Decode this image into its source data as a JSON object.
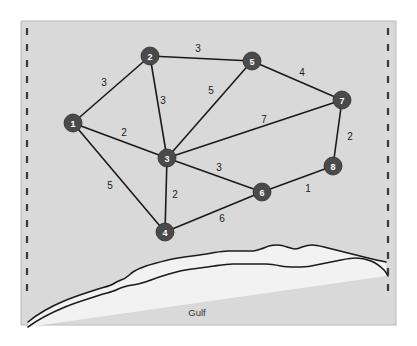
{
  "figure": {
    "caption": "Gulf",
    "background_color": "#d9d9d9",
    "frame_color": "#b9b9b9",
    "node_color": "#4a4a4a",
    "edge_color": "#1b1b1b",
    "dashed_border_color": "#3a3a3a",
    "coastline_color": "#1b1b1b",
    "water_color": "#f2f2f2"
  },
  "graph": {
    "type": "weighted-undirected-graph",
    "nodes": [
      {
        "id": "1",
        "label": "1",
        "x": 73,
        "y": 123
      },
      {
        "id": "2",
        "label": "2",
        "x": 150,
        "y": 56
      },
      {
        "id": "3",
        "label": "3",
        "x": 167,
        "y": 158
      },
      {
        "id": "4",
        "label": "4",
        "x": 165,
        "y": 232
      },
      {
        "id": "5",
        "label": "5",
        "x": 252,
        "y": 61
      },
      {
        "id": "6",
        "label": "6",
        "x": 262,
        "y": 192
      },
      {
        "id": "7",
        "label": "7",
        "x": 342,
        "y": 100
      },
      {
        "id": "8",
        "label": "8",
        "x": 333,
        "y": 166
      }
    ],
    "node_radius": 9,
    "edges": [
      {
        "from": "1",
        "to": "2",
        "weight": "3",
        "lx": 104,
        "ly": 82
      },
      {
        "from": "1",
        "to": "3",
        "weight": "2",
        "lx": 124,
        "ly": 132
      },
      {
        "from": "1",
        "to": "4",
        "weight": "5",
        "lx": 110,
        "ly": 185
      },
      {
        "from": "2",
        "to": "5",
        "weight": "3",
        "lx": 198,
        "ly": 48
      },
      {
        "from": "2",
        "to": "3",
        "weight": "3",
        "lx": 163,
        "ly": 100
      },
      {
        "from": "3",
        "to": "5",
        "weight": "5",
        "lx": 211,
        "ly": 90
      },
      {
        "from": "3",
        "to": "7",
        "weight": "7",
        "lx": 264,
        "ly": 119
      },
      {
        "from": "3",
        "to": "6",
        "weight": "3",
        "lx": 219,
        "ly": 167
      },
      {
        "from": "3",
        "to": "4",
        "weight": "2",
        "lx": 175,
        "ly": 194
      },
      {
        "from": "4",
        "to": "6",
        "weight": "6",
        "lx": 222,
        "ly": 218
      },
      {
        "from": "5",
        "to": "7",
        "weight": "4",
        "lx": 302,
        "ly": 72
      },
      {
        "from": "7",
        "to": "8",
        "weight": "2",
        "lx": 350,
        "ly": 136
      },
      {
        "from": "6",
        "to": "8",
        "weight": "1",
        "lx": 308,
        "ly": 188
      }
    ]
  },
  "frame": {
    "x": 21,
    "y": 21,
    "width": 375,
    "height": 304
  },
  "dashed_borders": {
    "left_x": 27,
    "right_x": 388,
    "top_y": 28,
    "bottom_y": 300
  },
  "coastline": {
    "top_path": "M 28,322 C 40,312 52,306 64,301 C 76,296 86,293 95,290 C 104,287 110,286 113,284 C 116,282 118,281 121,280 C 124,279 126,278 128,276 C 130,275 131,273 133,272 C 136,270 140,268 146,266 C 152,264 160,262 168,260 C 176,258 184,257 192,256 C 200,255 206,254 212,253 C 218,252 223,251 228,251 C 233,251 238,251 243,251 C 247,251 250,251 253,251 C 256,251 258,250 261,249 C 264,248 266,247 269,246 C 272,245 275,245 278,245 C 281,245 284,246 287,247 C 290,248 292,249 295,249 C 298,249 300,248 302,247 C 305,246 308,245 312,245 C 316,245 320,246 324,247 C 328,248 332,249 336,250 C 340,251 344,252 348,253 C 352,254 356,255 360,256 C 364,257 368,258 372,259 C 376,260 381,261 386,262",
    "bottom_path": "M 28,327 C 40,318 53,312 65,307 C 77,302 88,299 97,296 C 106,293 112,292 116,290 C 120,288 123,287 127,286 C 131,285 134,285 138,284 C 142,283 146,282 151,280 C 156,278 162,276 169,274 C 176,272 184,270 192,269 C 200,268 207,267 214,266 C 221,265 227,264 233,264 C 239,264 245,264 251,264 C 256,264 261,264 266,264 C 271,264 276,265 281,266 C 286,267 291,267 296,267 C 301,267 306,267 311,266 C 316,265 321,264 326,263 C 331,262 336,261 341,260 C 346,259 351,258 356,258 C 361,258 366,259 371,261 C 376,263 380,266 384,270 C 386,272 387,274 388,276"
  },
  "caption_position": {
    "x": 197,
    "y": 312
  }
}
